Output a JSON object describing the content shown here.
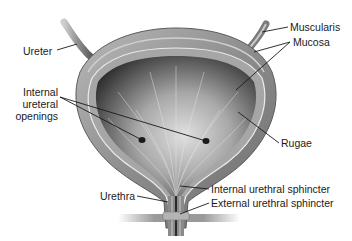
{
  "diagram": {
    "colors": {
      "background": "#ffffff",
      "outer_wall": "#8a8a8a",
      "muscularis_band": "#a9a9a9",
      "mucosa_line": "#e6e6e6",
      "lumen_dark": "#3a3a3a",
      "lumen_light": "#d8d8d8",
      "label_text": "#1a1a1a",
      "leader_line": "#1a1a1a"
    },
    "labels": {
      "ureter": "Ureter",
      "muscularis": "Muscularis",
      "mucosa": "Mucosa",
      "internal_ureteral_openings_line1": "Internal",
      "internal_ureteral_openings_line2": "ureteral",
      "internal_ureteral_openings_line3": "openings",
      "rugae": "Rugae",
      "urethra": "Urethra",
      "internal_urethral_sphincter": "Internal urethral sphincter",
      "external_urethral_sphincter": "External urethral sphincter"
    }
  }
}
